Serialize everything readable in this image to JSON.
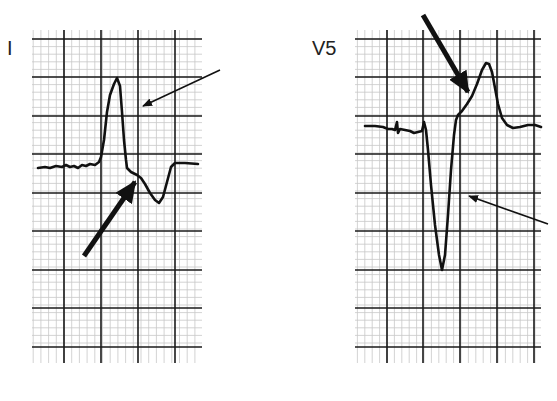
{
  "figure": {
    "type": "ECG lead comparison diagram",
    "panels": [
      {
        "lead_label": "I",
        "grid": {
          "x0": 32,
          "x1": 202,
          "y0": 30,
          "y1": 363,
          "major_h": [
            39,
            77,
            116,
            154,
            193,
            231,
            270,
            308,
            347
          ],
          "major_v": [
            64,
            101,
            138,
            175
          ],
          "minor_step": 7.7
        },
        "trace": "M38,168 L45,167 L50,168 L56,166 L62,167 L66,165 L70,167 L74,166 L78,168 L82,165 L86,166 L90,164 L95,165 L99,162 L101,157 L104,140 L107,112 L110,95 L114,84 L117,78 L120,86 L122,112 L124,140 L126,160 L127,168 L131,172 L137,175 L141,178 L145,184 L150,193 L155,200 L159,203 L163,197 L167,182 L171,167 L175,163 L185,163 L198,164",
        "arrows": [
          {
            "name": "thin-arrow",
            "x1": 220,
            "y1": 70,
            "x2": 143,
            "y2": 106,
            "weight": "thin"
          },
          {
            "name": "thick-arrow",
            "x1": 84,
            "y1": 256,
            "x2": 135,
            "y2": 182,
            "weight": "thick"
          }
        ]
      },
      {
        "lead_label": "V5",
        "grid": {
          "x0": 355,
          "x1": 541,
          "y0": 30,
          "y1": 363,
          "major_h": [
            39,
            77,
            116,
            154,
            193,
            231,
            270,
            308,
            347
          ],
          "major_v": [
            387,
            423,
            460,
            497,
            534
          ],
          "minor_step": 7.4
        },
        "trace": "M365,126 L375,126 L383,127 L388,129 L392,129 L395,130 L397,122 L398,133 L400,129 L405,130 L410,131 L414,133 L418,132 L422,131 L424,122 L426,130 L428,150 L431,185 L435,225 L439,255 L442,270 L445,255 L448,215 L451,170 L454,135 L456,120 L458,115 L462,111 L467,104 L472,96 L477,84 L482,70 L486,63 L489,64 L492,72 L495,88 L498,104 L502,118 L507,125 L513,128 L520,127 L528,125 L535,125 L541,127",
        "arrows": [
          {
            "name": "thick-arrow",
            "x1": 423,
            "y1": 15,
            "x2": 468,
            "y2": 92,
            "weight": "thick"
          },
          {
            "name": "thin-arrow",
            "x1": 548,
            "y1": 224,
            "x2": 469,
            "y2": 196,
            "weight": "thin"
          }
        ]
      }
    ],
    "colors": {
      "background": "#ffffff",
      "trace": "#111111",
      "major_grid": "#1a1a1a",
      "minor_grid": "#c8c8c8",
      "label": "#222222"
    }
  }
}
